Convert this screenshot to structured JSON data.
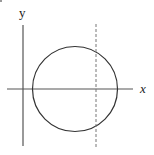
{
  "diagram": {
    "type": "circle-on-axes",
    "axes": {
      "x_label": "x",
      "y_label": "y"
    },
    "circle": {
      "cx": 75,
      "cy": 89,
      "r": 42
    },
    "dashed_line": {
      "orientation": "vertical",
      "x": 96
    },
    "colors": {
      "stroke": "#333333",
      "axis": "#555555",
      "dashed": "#777777"
    }
  }
}
